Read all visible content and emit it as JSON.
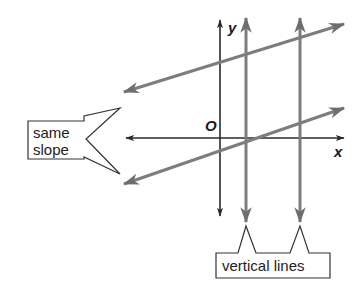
{
  "diagram": {
    "axis_labels": {
      "x": "x",
      "y": "y",
      "origin": "O"
    },
    "callouts": {
      "same_slope": [
        "same",
        "slope"
      ],
      "vertical_lines": "vertical lines"
    },
    "colors": {
      "axis": "#2a2a2a",
      "lines": "#7d7d7d",
      "text": "#222222"
    },
    "lines": [
      {
        "name": "upper-parallel-line",
        "type": "slanted",
        "note": "same slope"
      },
      {
        "name": "lower-parallel-line",
        "type": "slanted",
        "note": "same slope"
      },
      {
        "name": "left-vertical-line",
        "type": "vertical"
      },
      {
        "name": "right-vertical-line",
        "type": "vertical"
      }
    ]
  }
}
